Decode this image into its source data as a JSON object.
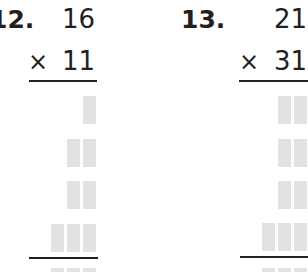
{
  "problems": [
    {
      "label": "12.",
      "multiplicand": "16",
      "operator": "×",
      "multiplier": "11",
      "answer_rows": [
        1,
        2,
        2,
        3,
        3
      ]
    },
    {
      "label": "13.",
      "multiplicand": "21",
      "operator": "×",
      "multiplier": "31",
      "answer_rows": [
        2,
        2,
        2,
        3,
        3
      ]
    }
  ],
  "colors": {
    "text": "#231f20",
    "answer_box": "#e2e2e2"
  }
}
